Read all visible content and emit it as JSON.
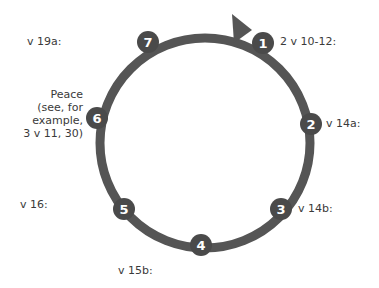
{
  "diagram": {
    "type": "cycle",
    "stroke_color": "#555555",
    "node_fill": "#4a4a4a",
    "node_text_color": "#ffffff",
    "center": [
      205,
      143
    ],
    "radius": 105,
    "nodes": [
      {
        "number": "1",
        "x": 263,
        "y": 43,
        "label": "2 v 10-12:"
      },
      {
        "number": "2",
        "x": 311,
        "y": 124,
        "label": "v 14a:"
      },
      {
        "number": "3",
        "x": 281,
        "y": 209,
        "label": "v 14b:"
      },
      {
        "number": "4",
        "x": 201,
        "y": 245,
        "label": "v 15b:"
      },
      {
        "number": "5",
        "x": 124,
        "y": 209,
        "label": "v 16:"
      },
      {
        "number": "6",
        "x": 97,
        "y": 118,
        "label_lines": [
          "Peace",
          "(see, for",
          "example,",
          "3 v 11, 30)"
        ]
      },
      {
        "number": "7",
        "x": 148,
        "y": 42,
        "label": "v 19a:"
      }
    ],
    "arrow": {
      "from_node": "7",
      "to_node": "1",
      "direction": "clockwise"
    }
  }
}
